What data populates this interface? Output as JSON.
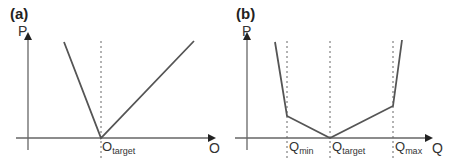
{
  "figure": {
    "panels": [
      {
        "id": "a",
        "label": "(a)",
        "y_axis_label": "P",
        "x_axis_label": "O",
        "markers": [
          {
            "main": "O",
            "sub": "target"
          }
        ],
        "curve": "V-shaped piecewise linear penalty with minimum (zero) at O_target; steeper left branch, shallower right branch"
      },
      {
        "id": "b",
        "label": "(b)",
        "y_axis_label": "P",
        "x_axis_label": "Q",
        "markers": [
          {
            "main": "Q",
            "sub": "min"
          },
          {
            "main": "Q",
            "sub": "target"
          },
          {
            "main": "Q",
            "sub": "max"
          }
        ],
        "curve": "Piecewise linear penalty: zero at Q_target, gentle slopes between Q_min and Q_max, steep slopes outside"
      }
    ],
    "colors": {
      "curve": "#555555",
      "axis": "#555555",
      "guide": "#555555"
    }
  }
}
